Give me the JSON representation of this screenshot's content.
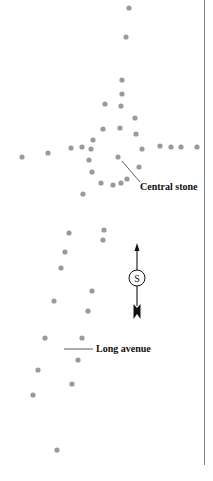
{
  "diagram": {
    "labels": {
      "central_stone": "Central stone",
      "long_avenue": "Long avenue",
      "compass_letter": "S"
    },
    "colors": {
      "stone": "#9a9a9a",
      "ink": "#111111",
      "border": "#888888"
    },
    "stones": [
      [
        129,
        8
      ],
      [
        126,
        37
      ],
      [
        122,
        80
      ],
      [
        122,
        94
      ],
      [
        105,
        104
      ],
      [
        121,
        106
      ],
      [
        135,
        118
      ],
      [
        103,
        129
      ],
      [
        120,
        128
      ],
      [
        136,
        134
      ],
      [
        93,
        140
      ],
      [
        71,
        148
      ],
      [
        82,
        147
      ],
      [
        91,
        149
      ],
      [
        142,
        149
      ],
      [
        160,
        146
      ],
      [
        171,
        147
      ],
      [
        181,
        147
      ],
      [
        197,
        147
      ],
      [
        22,
        157
      ],
      [
        48,
        153
      ],
      [
        118,
        157
      ],
      [
        89,
        160
      ],
      [
        139,
        167
      ],
      [
        92,
        172
      ],
      [
        101,
        183
      ],
      [
        113,
        185
      ],
      [
        121,
        183
      ],
      [
        127,
        179
      ],
      [
        83,
        194
      ],
      [
        69,
        233
      ],
      [
        104,
        230
      ],
      [
        103,
        240
      ],
      [
        65,
        252
      ],
      [
        61,
        268
      ],
      [
        92,
        291
      ],
      [
        54,
        301
      ],
      [
        88,
        311
      ],
      [
        45,
        338
      ],
      [
        82,
        338
      ],
      [
        78,
        360
      ],
      [
        38,
        370
      ],
      [
        72,
        384
      ],
      [
        33,
        395
      ],
      [
        57,
        450
      ]
    ]
  }
}
